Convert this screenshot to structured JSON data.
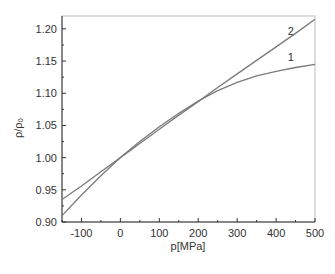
{
  "chart_data": {
    "type": "line",
    "title": "",
    "xlabel": "p[MPa]",
    "ylabel": "ρ/ρ₀",
    "xlim": [
      -150,
      500
    ],
    "ylim": [
      0.9,
      1.22
    ],
    "xticks": [
      -100,
      0,
      100,
      200,
      300,
      400,
      500
    ],
    "xtick_labels": [
      "-100",
      "0",
      "100",
      "200",
      "300",
      "400",
      "500"
    ],
    "yticks": [
      0.9,
      0.95,
      1.0,
      1.05,
      1.1,
      1.15,
      1.2
    ],
    "ytick_labels": [
      "0.90",
      "0.95",
      "1.00",
      "1.05",
      "1.10",
      "1.15",
      "1.20"
    ],
    "grid": false,
    "legend": "inline labels near curve ends",
    "series": [
      {
        "name": "1",
        "x": [
          -150,
          -100,
          -50,
          0,
          50,
          100,
          150,
          200,
          250,
          300,
          350,
          400,
          450,
          500
        ],
        "values": [
          0.91,
          0.942,
          0.972,
          1.0,
          1.025,
          1.048,
          1.069,
          1.088,
          1.104,
          1.117,
          1.127,
          1.134,
          1.14,
          1.145
        ]
      },
      {
        "name": "2",
        "x": [
          -150,
          -100,
          -50,
          0,
          50,
          100,
          150,
          200,
          250,
          300,
          350,
          400,
          450,
          500
        ],
        "values": [
          0.935,
          0.956,
          0.978,
          1.0,
          1.022,
          1.044,
          1.066,
          1.087,
          1.109,
          1.13,
          1.151,
          1.172,
          1.193,
          1.215
        ]
      }
    ],
    "annotations": [
      {
        "text": "2",
        "x": 430,
        "y": 1.19
      },
      {
        "text": "1",
        "x": 430,
        "y": 1.15
      }
    ]
  }
}
